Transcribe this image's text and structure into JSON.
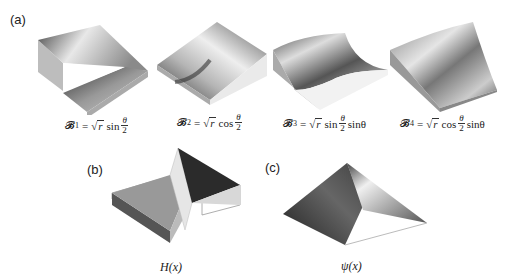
{
  "figure": {
    "panels": [
      {
        "id": "a",
        "label": "(a)"
      },
      {
        "id": "b",
        "label": "(b)"
      },
      {
        "id": "c",
        "label": "(c)"
      }
    ],
    "captions": {
      "b1": {
        "lhs": "𝓑",
        "sub": "1",
        "eq": "=",
        "root": "r",
        "trig": "sin",
        "num": "θ",
        "den": "2",
        "tail": ""
      },
      "b2": {
        "lhs": "𝓑",
        "sub": "2",
        "eq": "=",
        "root": "r",
        "trig": "cos",
        "num": "θ",
        "den": "2",
        "tail": ""
      },
      "b3": {
        "lhs": "𝓑",
        "sub": "3",
        "eq": "=",
        "root": "r",
        "trig": "sin",
        "num": "θ",
        "den": "2",
        "tail": "sinθ"
      },
      "b4": {
        "lhs": "𝓑",
        "sub": "4",
        "eq": "=",
        "root": "r",
        "trig": "cos",
        "num": "θ",
        "den": "2",
        "tail": "sinθ"
      },
      "H": "H(x)",
      "psi": "ψ(x)"
    }
  }
}
